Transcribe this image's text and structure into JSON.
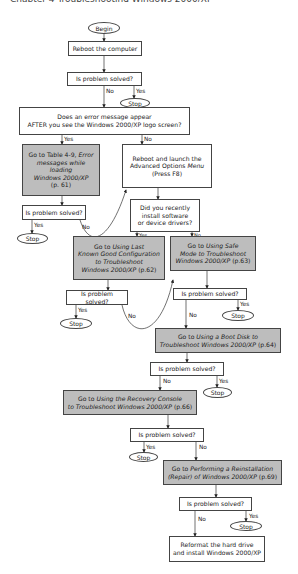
{
  "header": {
    "text": "Chapter 4  Troubleshooting Windows 2000/XP"
  },
  "nodes": {
    "begin": "Begin",
    "reboot": "Reboot the computer",
    "solved1": "Is problem solved?",
    "error_question_l1": "Does an error message appear",
    "error_question_l2": "AFTER you see the Windows 2000/XP logo screen?",
    "table_l1a": "Go to Table 4-9, ",
    "table_l1b": "Error",
    "table_l2": "messages while loading",
    "table_l3": "Windows 2000/XP",
    "table_l4": "(p. 61)",
    "solved_left": "Is problem solved?",
    "advanced_l1": "Reboot and launch the",
    "advanced_l2a": "Advanced Options ",
    "advanced_l2b": "Menu",
    "advanced_l3": "(Press F8)",
    "recent_l1": "Did you recently",
    "recent_l2": "install software",
    "recent_l3": "or device drivers?",
    "lkg_l1a": "Go to ",
    "lkg_l1b": "Using Last",
    "lkg_l2": "Known Good Configuration",
    "lkg_l3": "to Troubleshoot",
    "lkg_l4a": "Windows 2000/XP",
    "lkg_l4b": " (p.62)",
    "safe_l1a": "Go to ",
    "safe_l1b": "Using Safe",
    "safe_l2": "Mode to Troubleshoot",
    "safe_l3a": "Windows 2000/XP",
    "safe_l3b": " (p.63)",
    "solved_lkg": "Is problem solved?",
    "solved_safe": "Is problem solved?",
    "boot_l1a": "Go to ",
    "boot_l1b": "Using a Boot Disk to",
    "boot_l2a": "Troubleshoot Windows 2000/XP",
    "boot_l2b": " (p.64)",
    "solved_boot": "Is problem solved?",
    "recovery_l1a": "Go to ",
    "recovery_l1b": "Using the Recovery Console",
    "recovery_l2a": "to Troubleshoot Windows 2000/XP",
    "recovery_l2b": " (p.66)",
    "solved_recovery": "Is problem solved?",
    "reinstall_l1a": "Go to ",
    "reinstall_l1b": "Performing a Reinstallation",
    "reinstall_l2a": "(Repair)",
    "reinstall_l2b": " of Windows 2000/XP",
    "reinstall_l2c": " (p.69)",
    "solved_reinstall": "Is problem solved?",
    "reformat_l1": "Reformat the hard drive",
    "reformat_l2": "and install Windows 2000/XP",
    "stop": "Stop"
  },
  "labels": {
    "yes": "Yes",
    "no": "No"
  },
  "colors": {
    "fill_gray": "#bdbdbd",
    "stroke": "#444444"
  }
}
